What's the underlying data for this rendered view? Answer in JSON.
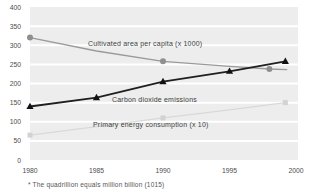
{
  "chart_data": {
    "type": "line",
    "title": "",
    "xlabel": "",
    "ylabel": "",
    "xlim": [
      1980,
      2000
    ],
    "ylim": [
      0,
      400
    ],
    "xticks": [
      1980,
      1985,
      1990,
      1995,
      2000
    ],
    "yticks": [
      0,
      50,
      100,
      150,
      200,
      250,
      300,
      350,
      400
    ],
    "grid": "horizontal white gridlines on gray banded plot background",
    "legend_position": "inline-labels-on-chart",
    "series": [
      {
        "name": "cultivated-area-per-capita",
        "label": "Cultivated area per capita (x 1000)",
        "color": "#9a9a9a",
        "marker": "circle",
        "marker_color": "#8f8f8f",
        "line_width": 1.3,
        "points": [
          [
            1980,
            320
          ],
          [
            1985,
            285
          ],
          [
            1990,
            258
          ],
          [
            1995,
            245
          ],
          [
            1998,
            238
          ],
          [
            1999.3,
            236
          ]
        ],
        "marker_points": [
          [
            1980,
            320
          ],
          [
            1990,
            258
          ],
          [
            1998,
            238
          ]
        ]
      },
      {
        "name": "carbon-dioxide-emissions",
        "label": "Carbon dioxide emissions",
        "color": "#1f1f1f",
        "marker": "triangle",
        "marker_color": "#111111",
        "line_width": 1.8,
        "points": [
          [
            1980,
            140
          ],
          [
            1985,
            163
          ],
          [
            1990,
            205
          ],
          [
            1995,
            232
          ],
          [
            1999.2,
            258
          ]
        ],
        "marker_points": [
          [
            1980,
            140
          ],
          [
            1985,
            163
          ],
          [
            1990,
            205
          ],
          [
            1995,
            232
          ],
          [
            1999.2,
            258
          ]
        ]
      },
      {
        "name": "primary-energy-consumption",
        "label": "Primary energy consumption (x 10)",
        "color": "#d9d9d9",
        "marker": "square",
        "marker_color": "#d2d2d2",
        "line_width": 1.3,
        "points": [
          [
            1980,
            65
          ],
          [
            1985,
            87
          ],
          [
            1990,
            110
          ],
          [
            1995,
            131
          ],
          [
            1999.2,
            150
          ]
        ],
        "marker_points": [
          [
            1980,
            65
          ],
          [
            1990,
            110
          ],
          [
            1999.2,
            150
          ]
        ]
      }
    ],
    "footnote": "* The quadrillion equals million billion (1015)"
  },
  "colors": {
    "page_bg": "#ffffff",
    "plot_bg": "#ededed",
    "gridline": "#ffffff",
    "tick_text": "#4d4d4d",
    "series_label_text": "#3d3d3d",
    "footnote_text": "#555555"
  }
}
